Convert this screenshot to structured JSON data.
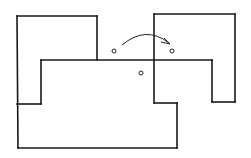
{
  "diagram": {
    "type": "polyomino-rotation-figure",
    "stroke_color": "#1a1a1a",
    "background_color": "#ffffff",
    "segments": [
      {
        "id": "left-top",
        "x1": 17,
        "y1": 16,
        "x2": 97,
        "y2": 16
      },
      {
        "id": "left-top-right",
        "x1": 97,
        "y1": 16,
        "x2": 97,
        "y2": 60
      },
      {
        "id": "left-outer",
        "x1": 17,
        "y1": 16,
        "x2": 18,
        "y2": 148
      },
      {
        "id": "middle-horizontal",
        "x1": 41,
        "y1": 60,
        "x2": 212,
        "y2": 60
      },
      {
        "id": "left-inner-step",
        "x1": 41,
        "y1": 60,
        "x2": 41,
        "y2": 104
      },
      {
        "id": "left-inner-foot",
        "x1": 17,
        "y1": 104,
        "x2": 41,
        "y2": 104
      },
      {
        "id": "right-inner",
        "x1": 212,
        "y1": 60,
        "x2": 212,
        "y2": 102
      },
      {
        "id": "right-foot",
        "x1": 212,
        "y1": 102,
        "x2": 235,
        "y2": 102
      },
      {
        "id": "right-outer",
        "x1": 235,
        "y1": 14,
        "x2": 235,
        "y2": 102
      },
      {
        "id": "right-top",
        "x1": 154,
        "y1": 14,
        "x2": 235,
        "y2": 14
      },
      {
        "id": "center-vertical",
        "x1": 154,
        "y1": 14,
        "x2": 154,
        "y2": 103
      },
      {
        "id": "center-step",
        "x1": 154,
        "y1": 103,
        "x2": 177,
        "y2": 103
      },
      {
        "id": "bottom-right",
        "x1": 177,
        "y1": 103,
        "x2": 177,
        "y2": 148
      },
      {
        "id": "bottom",
        "x1": 18,
        "y1": 148,
        "x2": 177,
        "y2": 148
      }
    ],
    "points": [
      {
        "id": "rotation-source-point",
        "cx": 114,
        "cy": 51,
        "r": 2
      },
      {
        "id": "rotation-target-point",
        "cx": 172,
        "cy": 51,
        "r": 2
      },
      {
        "id": "rotation-center-point",
        "cx": 141,
        "cy": 73,
        "r": 2
      }
    ],
    "arrow": {
      "id": "rotation-arrow",
      "path": "M 122 45 Q 146 25 169 43",
      "head": "164,38 170,44 161,42"
    }
  }
}
